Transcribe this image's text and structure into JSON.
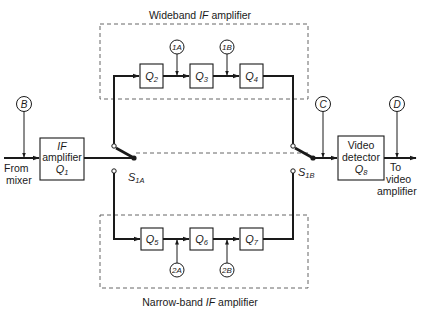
{
  "diagram": {
    "wideband_title": {
      "prefix": "Wideband ",
      "italic": "IF",
      "suffix": " amplifier"
    },
    "narrowband_title": {
      "prefix": "Narrow-band ",
      "italic": "IF",
      "suffix": " amplifier"
    },
    "input": {
      "line1": "From",
      "line2": "mixer"
    },
    "output": {
      "line1": "To",
      "line2": "video",
      "line3": "amplifier"
    },
    "if_amplifier": {
      "line1": "IF",
      "line2": "amplifier",
      "line3": "Q",
      "sub": "1"
    },
    "video_detector": {
      "line1": "Video",
      "line2": "detector",
      "line3": "Q",
      "sub": "8"
    },
    "wideband_stages": [
      {
        "label": "Q",
        "sub": "2"
      },
      {
        "label": "Q",
        "sub": "3"
      },
      {
        "label": "Q",
        "sub": "4"
      }
    ],
    "narrowband_stages": [
      {
        "label": "Q",
        "sub": "5"
      },
      {
        "label": "Q",
        "sub": "6"
      },
      {
        "label": "Q",
        "sub": "7"
      }
    ],
    "test_points": {
      "B": "B",
      "C": "C",
      "D": "D",
      "1A": "1A",
      "1B": "1B",
      "2A": "2A",
      "2B": "2B"
    },
    "switches": {
      "s1a": {
        "label": "S",
        "sub": "1A"
      },
      "s1b": {
        "label": "S",
        "sub": "1B"
      }
    },
    "colors": {
      "ink": "#1a1a1a",
      "dashed": "#555555",
      "background": "#ffffff"
    }
  }
}
